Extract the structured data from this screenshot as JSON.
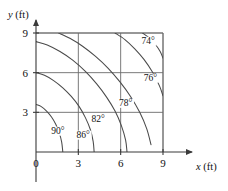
{
  "chart_data": {
    "type": "line",
    "title": "",
    "subtitle": "",
    "xlabel": "x (ft)",
    "ylabel": "y (ft)",
    "xlim": [
      0,
      10.2
    ],
    "ylim": [
      0,
      10.2
    ],
    "xticks": [
      0,
      3,
      6,
      9
    ],
    "yticks": [
      0,
      3,
      6,
      9
    ],
    "xticklabels": [
      "0",
      "3",
      "6",
      "9"
    ],
    "yticklabels": [
      "0",
      "3",
      "6",
      "9"
    ],
    "grid": true,
    "legend_position": "none",
    "annotation_note": "Isotherm contour map of temperature in degrees Fahrenheit over a 9 ft by 9 ft square region",
    "series": [
      {
        "name": "90°",
        "label": "90°",
        "label_x": 1.55,
        "label_y": 1.35,
        "points": [
          [
            0.0,
            3.6
          ],
          [
            0.35,
            3.45
          ],
          [
            0.75,
            3.1
          ],
          [
            1.1,
            2.65
          ],
          [
            1.4,
            2.1
          ],
          [
            1.65,
            1.45
          ],
          [
            1.82,
            0.75
          ],
          [
            1.9,
            0.0
          ]
        ]
      },
      {
        "name": "86°",
        "label": "86°",
        "label_x": 3.35,
        "label_y": 1.05,
        "points": [
          [
            0.0,
            6.0
          ],
          [
            0.6,
            5.8
          ],
          [
            1.25,
            5.4
          ],
          [
            1.9,
            4.85
          ],
          [
            2.5,
            4.2
          ],
          [
            3.05,
            3.45
          ],
          [
            3.5,
            2.6
          ],
          [
            3.85,
            1.7
          ],
          [
            4.05,
            0.8
          ],
          [
            4.12,
            0.0
          ]
        ]
      },
      {
        "name": "82°",
        "label": "82°",
        "label_x": 4.4,
        "label_y": 2.25,
        "points": [
          [
            0.0,
            8.35
          ],
          [
            0.8,
            8.1
          ],
          [
            1.7,
            7.6
          ],
          [
            2.6,
            6.95
          ],
          [
            3.5,
            6.1
          ],
          [
            4.3,
            5.15
          ],
          [
            5.0,
            4.15
          ],
          [
            5.6,
            3.1
          ],
          [
            6.05,
            2.0
          ],
          [
            6.35,
            0.9
          ],
          [
            6.45,
            0.0
          ]
        ]
      },
      {
        "name": "78°",
        "label": "78°",
        "label_x": 6.35,
        "label_y": 3.45,
        "points": [
          [
            1.6,
            9.0
          ],
          [
            2.4,
            8.6
          ],
          [
            3.3,
            8.0
          ],
          [
            4.2,
            7.25
          ],
          [
            5.1,
            6.35
          ],
          [
            5.95,
            5.3
          ],
          [
            6.7,
            4.2
          ],
          [
            7.35,
            3.0
          ],
          [
            7.85,
            1.75
          ],
          [
            8.15,
            0.55
          ]
        ]
      },
      {
        "name": "76°",
        "label": "76°",
        "label_x": 8.1,
        "label_y": 5.35,
        "points": [
          [
            5.6,
            9.0
          ],
          [
            6.3,
            8.5
          ],
          [
            7.0,
            7.8
          ],
          [
            7.65,
            7.0
          ],
          [
            8.25,
            6.05
          ],
          [
            8.75,
            5.0
          ],
          [
            9.0,
            4.25
          ]
        ]
      },
      {
        "name": "74°",
        "label": "74°",
        "label_x": 7.95,
        "label_y": 8.15,
        "points": [
          [
            7.55,
            9.0
          ],
          [
            8.0,
            8.65
          ],
          [
            8.45,
            8.15
          ],
          [
            8.8,
            7.6
          ],
          [
            9.0,
            7.1
          ]
        ]
      }
    ]
  },
  "axes": {
    "x_title_var": "x",
    "x_title_unit": " (ft)",
    "y_title_var": "y",
    "y_title_unit": " (ft)"
  }
}
